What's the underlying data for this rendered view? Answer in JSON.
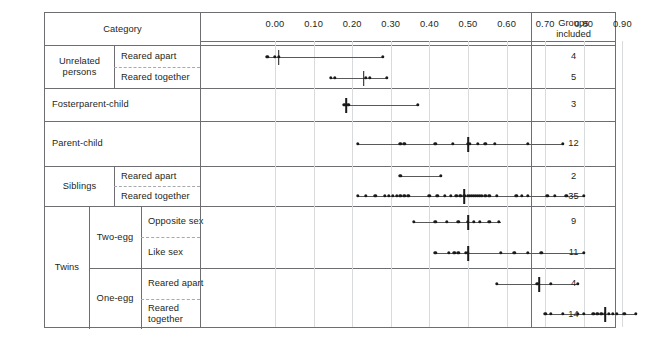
{
  "figure": {
    "category_header": "Category",
    "groups_header_line1": "Groups",
    "groups_header_line2": "included"
  },
  "chart_data": {
    "type": "scatter",
    "title": "",
    "xlabel": "",
    "ylabel": "",
    "xlim": [
      -0.05,
      0.96
    ],
    "grid": true,
    "legend": "none",
    "tick_labels": [
      "0.00",
      "0.10",
      "0.20",
      "0.30",
      "0.40",
      "0.50",
      "0.60",
      "0.70",
      "0.80",
      "0.90"
    ],
    "tick_values": [
      0.0,
      0.1,
      0.2,
      0.3,
      0.4,
      0.5,
      0.6,
      0.7,
      0.8,
      0.9
    ],
    "categories": [
      {
        "group": "Unrelated persons",
        "subgroup": "",
        "condition": "Reared apart",
        "groups_included": "4",
        "range": [
          -0.02,
          0.28
        ],
        "median": 0.01,
        "values": [
          -0.02,
          0.0,
          0.01,
          0.28
        ]
      },
      {
        "group": "Unrelated persons",
        "subgroup": "",
        "condition": "Reared together",
        "groups_included": "5",
        "range": [
          0.145,
          0.29
        ],
        "median": 0.23,
        "values": [
          0.145,
          0.155,
          0.235,
          0.245,
          0.29
        ]
      },
      {
        "group": "Fosterparent-child",
        "subgroup": "",
        "condition": "",
        "groups_included": "3",
        "range": [
          0.18,
          0.37
        ],
        "median": 0.185,
        "values": [
          0.18,
          0.19,
          0.37
        ]
      },
      {
        "group": "Parent-child",
        "subgroup": "",
        "condition": "",
        "groups_included": "12",
        "range": [
          0.215,
          0.745
        ],
        "median": 0.5,
        "values": [
          0.215,
          0.325,
          0.335,
          0.415,
          0.46,
          0.5,
          0.505,
          0.525,
          0.545,
          0.57,
          0.655,
          0.745
        ]
      },
      {
        "group": "Siblings",
        "subgroup": "",
        "condition": "Reared apart",
        "groups_included": "2",
        "range": [
          0.325,
          0.43
        ],
        "median": null,
        "values": [
          0.325,
          0.43
        ]
      },
      {
        "group": "Siblings",
        "subgroup": "",
        "condition": "Reared together",
        "groups_included": "35",
        "range": [
          0.215,
          0.8
        ],
        "median": 0.49,
        "values": [
          0.215,
          0.235,
          0.26,
          0.285,
          0.295,
          0.305,
          0.315,
          0.325,
          0.335,
          0.345,
          0.4,
          0.42,
          0.44,
          0.455,
          0.47,
          0.48,
          0.49,
          0.5,
          0.505,
          0.51,
          0.515,
          0.52,
          0.525,
          0.53,
          0.535,
          0.545,
          0.555,
          0.575,
          0.625,
          0.64,
          0.655,
          0.705,
          0.725,
          0.755,
          0.8
        ]
      },
      {
        "group": "Twins",
        "subgroup": "Two-egg",
        "condition": "Opposite sex",
        "groups_included": "9",
        "range": [
          0.36,
          0.585
        ],
        "median": 0.5,
        "values": [
          0.36,
          0.415,
          0.445,
          0.475,
          0.5,
          0.515,
          0.53,
          0.555,
          0.58
        ]
      },
      {
        "group": "Twins",
        "subgroup": "Two-egg",
        "condition": "Like sex",
        "groups_included": "11",
        "range": [
          0.415,
          0.8
        ],
        "median": 0.5,
        "values": [
          0.415,
          0.45,
          0.465,
          0.475,
          0.495,
          0.5,
          0.585,
          0.62,
          0.655,
          0.69,
          0.8
        ]
      },
      {
        "group": "Twins",
        "subgroup": "One-egg",
        "condition": "Reared apart",
        "groups_included": "4",
        "range": [
          0.575,
          0.785
        ],
        "median": 0.685,
        "values": [
          0.575,
          0.68,
          0.715,
          0.785
        ]
      },
      {
        "group": "Twins",
        "subgroup": "One-egg",
        "condition": "Reared together",
        "groups_included": "14",
        "range": [
          0.7,
          0.935
        ],
        "median": 0.855,
        "values": [
          0.7,
          0.715,
          0.745,
          0.785,
          0.8,
          0.825,
          0.835,
          0.845,
          0.855,
          0.865,
          0.875,
          0.885,
          0.905,
          0.935
        ]
      }
    ]
  },
  "labels": {
    "unrelated_persons_l1": "Unrelated",
    "unrelated_persons_l2": "persons",
    "reared_apart": "Reared apart",
    "reared_together": "Reared together",
    "fosterparent_child": "Fosterparent-child",
    "parent_child": "Parent-child",
    "siblings": "Siblings",
    "twins": "Twins",
    "two_egg": "Two-egg",
    "one_egg": "One-egg",
    "opposite_sex": "Opposite sex",
    "like_sex": "Like sex"
  }
}
